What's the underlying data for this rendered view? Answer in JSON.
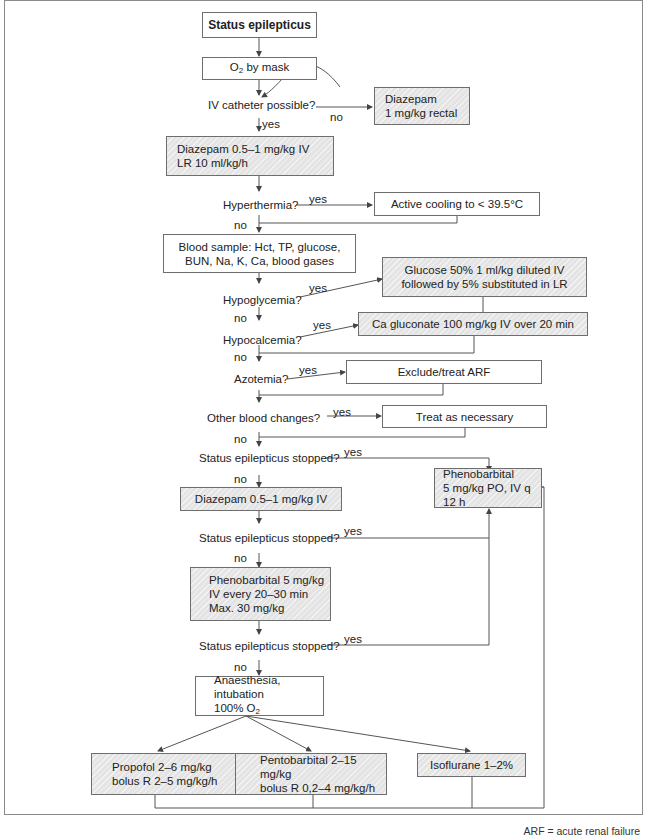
{
  "title": "Status epilepticus",
  "nodes": {
    "start": "Status epilepticus",
    "o2_mask": {
      "text": "O",
      "sub": "2",
      "rest": " by mask"
    },
    "diazepam_rectal": [
      "Diazepam",
      "1 mg/kg rectal"
    ],
    "diazepam_iv_lr": [
      "Diazepam 0.5–1 mg/kg IV",
      "LR 10 ml/kg/h"
    ],
    "active_cooling": "Active cooling to < 39.5°C",
    "blood_sample": [
      "Blood sample: Hct, TP, glucose,",
      "BUN, Na, K, Ca, blood gases"
    ],
    "glucose": [
      "Glucose 50% 1 ml/kg diluted IV",
      "followed by 5% substituted in LR"
    ],
    "ca_gluconate": "Ca gluconate 100 mg/kg IV over 20 min",
    "exclude_arf": "Exclude/treat ARF",
    "treat_necessary": "Treat as necessary",
    "phenobarbital_maint": [
      "Phenobarbital",
      "5 mg/kg PO, IV q 12 h"
    ],
    "diazepam_iv": "Diazepam 0.5–1 mg/kg IV",
    "phenobarbital_load": [
      "Phenobarbital 5 mg/kg",
      "IV every 20–30 min",
      "Max. 30 mg/kg"
    ],
    "anaesthesia": {
      "line1": "Anaesthesia, intubation",
      "line2": "100% O",
      "sub": "2"
    },
    "propofol": [
      "Propofol 2–6 mg/kg",
      "bolus R 2–5 mg/kg/h"
    ],
    "pentobarbital": [
      "Pentobarbital 2–15 mg/kg",
      "bolus R 0,2–4 mg/kg/h"
    ],
    "isoflurane": "Isoflurane 1–2%"
  },
  "questions": {
    "iv_catheter": "IV catheter possible?",
    "hyperthermia": "Hyperthermia?",
    "hypoglycemia": "Hypoglycemia?",
    "hypocalcemia": "Hypocalcemia?",
    "azotemia": "Azotemia?",
    "other_blood": "Other blood changes?",
    "stopped_1": "Status epilepticus stopped?",
    "stopped_2": "Status epilepticus stopped?",
    "stopped_3": "Status epilepticus stopped?"
  },
  "edge_labels": {
    "yes": "yes",
    "no": "no"
  },
  "footnote": "ARF = acute renal failure",
  "colors": {
    "border": "#6e6e6e",
    "hatch_fill": "#e4e4e4",
    "line": "#555555"
  }
}
